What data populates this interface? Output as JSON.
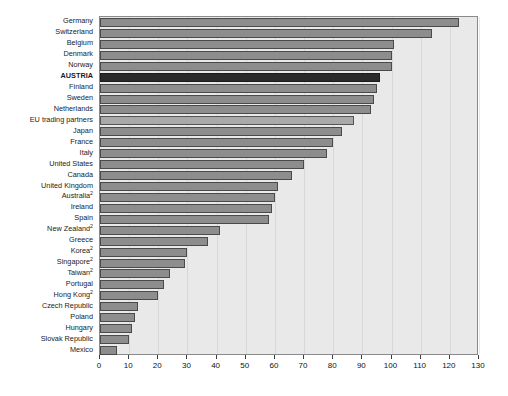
{
  "chart_data": {
    "type": "bar",
    "orientation": "horizontal",
    "title": "",
    "subtitle": "",
    "xlabel": "",
    "ylabel": "",
    "xlim": [
      0,
      130
    ],
    "xticks": [
      0,
      10,
      20,
      30,
      40,
      50,
      60,
      70,
      80,
      90,
      100,
      110,
      120,
      130
    ],
    "grid": true,
    "legend": "none",
    "categories": [
      "Germany",
      "Switzerland",
      "Belgium",
      "Denmark",
      "Norway",
      "AUSTRIA",
      "Finland",
      "Sweden",
      "Netherlands",
      "EU trading partners",
      "Japan",
      "France",
      "Italy",
      "United States",
      "Canada",
      "United Kingdom",
      "Australia",
      "Ireland",
      "Spain",
      "New Zealand",
      "Greece",
      "Korea",
      "Singapore",
      "Taiwan",
      "Portugal",
      "Hong Kong",
      "Czech Republic",
      "Poland",
      "Hungary",
      "Slovak Republic",
      "Mexico"
    ],
    "category_superscripts": [
      "",
      "",
      "",
      "",
      "",
      "",
      "",
      "",
      "",
      "",
      "",
      "",
      "",
      "",
      "",
      "",
      "2",
      "",
      "",
      "2",
      "",
      "2",
      "2",
      "2",
      "",
      "2",
      "",
      "",
      "",
      "",
      ""
    ],
    "values": [
      123,
      114,
      101,
      100,
      100,
      96,
      95,
      94,
      93,
      87,
      83,
      80,
      78,
      70,
      66,
      61,
      60,
      59,
      58,
      41,
      37,
      30,
      29,
      24,
      22,
      20,
      13,
      12,
      11,
      10,
      6
    ],
    "highlight_category": "AUSTRIA",
    "light_category": "EU trading partners",
    "colors": {
      "bar": "#8d8d8d",
      "bar_border": "#4a4a4a",
      "bar_highlight": "#2a2a2a",
      "bar_light": "#a9a9a9",
      "plot_background": "#e9e9e9",
      "page_background": "#ffffff",
      "axis": "#3b3b3b",
      "text": "#1b1b1b"
    }
  }
}
